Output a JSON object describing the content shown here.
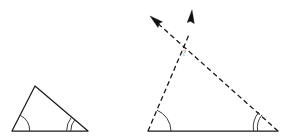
{
  "figure": {
    "background_color": "#ffffff",
    "line_color": "#1a1a1a",
    "arc_color": "#3a3a3a",
    "unknown_label": "?",
    "unknown_label_color": "#8a8a8a",
    "shapes": [
      {
        "name": "small-triangle",
        "line_style": "solid",
        "vertices": {
          "bottom_left": [
            12,
            131
          ],
          "apex": [
            35,
            86
          ],
          "bottom_right": [
            88,
            131
          ]
        },
        "angle_marks": [
          {
            "vertex": "bottom_left",
            "arcs": 1
          },
          {
            "vertex": "bottom_right",
            "arcs": 2
          },
          {
            "vertex": "apex",
            "arcs": 0
          }
        ]
      },
      {
        "name": "large-triangle",
        "line_style": "dashed",
        "vertices": {
          "bottom_left": [
            148,
            131
          ],
          "apex": [
            185,
            44
          ],
          "bottom_right": [
            278,
            131
          ]
        },
        "baseline_style": "solid",
        "angle_marks": [
          {
            "vertex": "bottom_left",
            "arcs": 1
          },
          {
            "vertex": "bottom_right",
            "arcs": 2
          },
          {
            "vertex": "apex",
            "arcs": 0,
            "label": "?"
          }
        ],
        "rays": [
          {
            "name": "ray-upper-left",
            "from_vertex": "bottom_right",
            "through": "apex",
            "tip": [
              150,
              16
            ],
            "arrowhead": true,
            "direction": "up-left"
          },
          {
            "name": "ray-upper-right",
            "from_vertex": "bottom_left",
            "through": "apex",
            "tip": [
              192,
              10
            ],
            "arrowhead": true,
            "direction": "up-right"
          }
        ]
      }
    ]
  }
}
